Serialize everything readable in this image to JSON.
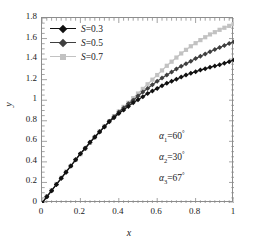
{
  "chart_data": {
    "type": "line",
    "title": "",
    "xlabel": "x",
    "ylabel": "y",
    "xlim": [
      0,
      1
    ],
    "ylim": [
      0,
      1.8
    ],
    "grid": false,
    "legend_position": "upper left",
    "xticks": [
      "0",
      "0.2",
      "0.4",
      "0.6",
      "0.8",
      "1"
    ],
    "xtick_values": [
      0,
      0.2,
      0.4,
      0.6,
      0.8,
      1
    ],
    "yticks": [
      "0",
      "0.2",
      "0.4",
      "0.6",
      "0.8",
      "1",
      "1.2",
      "1.4",
      "1.6",
      "1.8"
    ],
    "ytick_values": [
      0,
      0.2,
      0.4,
      0.6,
      0.8,
      1,
      1.2,
      1.4,
      1.6,
      1.8
    ],
    "x": [
      0,
      0.025,
      0.05,
      0.075,
      0.1,
      0.125,
      0.15,
      0.175,
      0.2,
      0.225,
      0.25,
      0.275,
      0.3,
      0.325,
      0.35,
      0.375,
      0.4,
      0.425,
      0.45,
      0.475,
      0.5,
      0.525,
      0.55,
      0.575,
      0.6,
      0.625,
      0.65,
      0.675,
      0.7,
      0.725,
      0.75,
      0.775,
      0.8,
      0.825,
      0.85,
      0.875,
      0.9,
      0.925,
      0.95,
      0.975,
      1
    ],
    "series": [
      {
        "name": "S=0.3",
        "label": "S=0.3",
        "color": "#111111",
        "marker": "diamond",
        "values": [
          0.0,
          0.06,
          0.12,
          0.18,
          0.24,
          0.3,
          0.36,
          0.42,
          0.48,
          0.53,
          0.59,
          0.64,
          0.69,
          0.74,
          0.79,
          0.83,
          0.87,
          0.905,
          0.94,
          0.975,
          1.005,
          1.035,
          1.065,
          1.09,
          1.115,
          1.14,
          1.165,
          1.185,
          1.205,
          1.225,
          1.245,
          1.262,
          1.278,
          1.293,
          1.307,
          1.32,
          1.333,
          1.345,
          1.36,
          1.375,
          1.392
        ]
      },
      {
        "name": "S=0.5",
        "label": "S=0.5",
        "color": "#3f3f3f",
        "marker": "diamond",
        "values": [
          0.0,
          0.06,
          0.12,
          0.18,
          0.24,
          0.3,
          0.36,
          0.42,
          0.48,
          0.535,
          0.59,
          0.645,
          0.695,
          0.745,
          0.795,
          0.84,
          0.885,
          0.925,
          0.965,
          1.0,
          1.04,
          1.08,
          1.115,
          1.15,
          1.185,
          1.215,
          1.245,
          1.275,
          1.305,
          1.33,
          1.355,
          1.38,
          1.405,
          1.428,
          1.45,
          1.472,
          1.493,
          1.513,
          1.533,
          1.552,
          1.57
        ]
      },
      {
        "name": "S=0.7",
        "label": "S=0.7",
        "color": "#c2c2c2",
        "marker": "square",
        "values": [
          0.0,
          0.065,
          0.125,
          0.185,
          0.245,
          0.305,
          0.36,
          0.42,
          0.475,
          0.53,
          0.585,
          0.64,
          0.695,
          0.745,
          0.795,
          0.845,
          0.89,
          0.935,
          0.975,
          1.02,
          1.065,
          1.11,
          1.155,
          1.2,
          1.245,
          1.29,
          1.335,
          1.375,
          1.415,
          1.455,
          1.49,
          1.525,
          1.555,
          1.585,
          1.613,
          1.64,
          1.662,
          1.685,
          1.705,
          1.723,
          1.74
        ]
      }
    ],
    "annotations": [
      {
        "id": "alpha1",
        "symbol": "α",
        "sub": "1",
        "value": "60",
        "unit": "°",
        "text": "α1=60°"
      },
      {
        "id": "alpha2",
        "symbol": "α",
        "sub": "2",
        "value": "30",
        "unit": "°",
        "text": "α2=30°"
      },
      {
        "id": "alpha3",
        "symbol": "α",
        "sub": "3",
        "value": "67",
        "unit": "°",
        "text": "α3=67°"
      }
    ],
    "colors": {
      "axis": "#8c8c8c",
      "text": "#1a1a1a",
      "series1": "#111111",
      "series2": "#3f3f3f",
      "series3": "#c2c2c2",
      "background": "#ffffff"
    }
  },
  "legend": {
    "items": [
      {
        "label": "S=0.3",
        "var": "S",
        "eqval": "=0.3"
      },
      {
        "label": "S=0.5",
        "var": "S",
        "eqval": "=0.5"
      },
      {
        "label": "S=0.7",
        "var": "S",
        "eqval": "=0.7"
      }
    ]
  },
  "axes": {
    "x_title": "x",
    "y_title": "y"
  }
}
